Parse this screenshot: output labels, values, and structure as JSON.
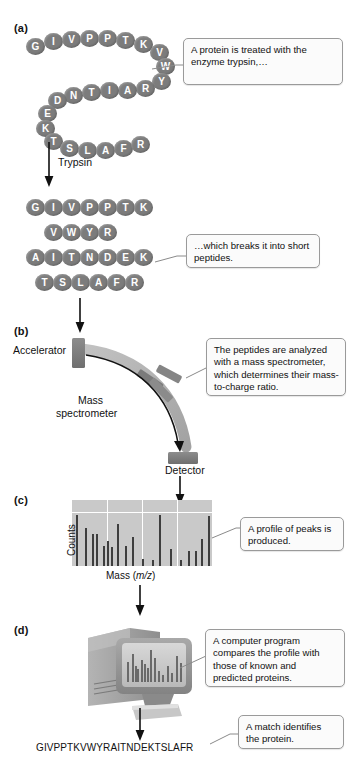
{
  "figure": {
    "panels": {
      "a": "(a)",
      "b": "(b)",
      "c": "(c)",
      "d": "(d)"
    }
  },
  "panel_a": {
    "protein_sequence": "GIVPPTKVWYRAITNDEKTSLAFR",
    "chain_residues": [
      "G",
      "I",
      "V",
      "P",
      "P",
      "T",
      "K",
      "V",
      "W",
      "Y",
      "R",
      "A",
      "I",
      "T",
      "N",
      "D",
      "E",
      "K",
      "T",
      "S",
      "L",
      "A",
      "F",
      "R"
    ],
    "arrow_label": "Trypsin",
    "callout": "A protein is treated with the enzyme trypsin,…",
    "peptides": [
      {
        "residues": [
          "G",
          "I",
          "V",
          "P",
          "P",
          "T",
          "K"
        ],
        "sequence": "GIVPPTK"
      },
      {
        "residues": [
          "V",
          "W",
          "Y",
          "R"
        ],
        "sequence": "VWYR"
      },
      {
        "residues": [
          "A",
          "I",
          "T",
          "N",
          "D",
          "E",
          "K"
        ],
        "sequence": "AITNDEK"
      },
      {
        "residues": [
          "T",
          "S",
          "L",
          "A",
          "F",
          "R"
        ],
        "sequence": "TSLAFR"
      }
    ],
    "peptides_callout": "…which breaks it into short peptides."
  },
  "panel_b": {
    "accelerator_label": "Accelerator",
    "instrument_label_line1": "Mass",
    "instrument_label_line2": "spectrometer",
    "detector_label": "Detector",
    "callout": "The peptides are analyzed with a mass spectrometer, which determines their mass-to-charge ratio."
  },
  "panel_c": {
    "callout": "A profile of peaks is produced.",
    "chart_data": {
      "type": "bar",
      "title": "",
      "xlabel": "Mass (m/z)",
      "ylabel": "Counts",
      "xlabel_prefix": "Mass (",
      "xlabel_italic": "m/z",
      "xlabel_suffix": ")",
      "grid": true,
      "legend": "none",
      "ylim": [
        0,
        100
      ],
      "x": [
        3,
        9,
        14,
        17,
        22,
        25,
        28,
        32,
        38,
        43,
        50,
        57,
        62,
        70,
        77,
        83,
        88,
        92,
        97
      ],
      "values": [
        82,
        62,
        52,
        52,
        33,
        40,
        30,
        68,
        33,
        47,
        11,
        9,
        82,
        27,
        10,
        25,
        24,
        44,
        80
      ]
    }
  },
  "panel_d": {
    "callout": "A computer program compares the profile with those of known and predicted proteins.",
    "match_callout": "A match identifies the protein.",
    "identified_sequence": "GIVPPTKVWYRAITNDEKTSLAFR",
    "screen_chart": {
      "type": "bar",
      "x": [
        5,
        13,
        18,
        22,
        28,
        33,
        38,
        43,
        50,
        57,
        64,
        72,
        79,
        86,
        93
      ],
      "values": [
        55,
        78,
        44,
        35,
        62,
        50,
        40,
        88,
        66,
        30,
        20,
        45,
        25,
        72,
        52
      ]
    }
  },
  "colors": {
    "bead": "#7c7c7c",
    "bead_text": "#ffffff",
    "spectrum_bg": "#c9c9c9",
    "spectrum_bar": "#3e3e3e",
    "callout_bg": "#fbfbfb",
    "callout_border": "#9a9a9a",
    "arc": "#b0b0b0",
    "block": "#7f7f7f",
    "computer_body": "#9a9a9a"
  }
}
